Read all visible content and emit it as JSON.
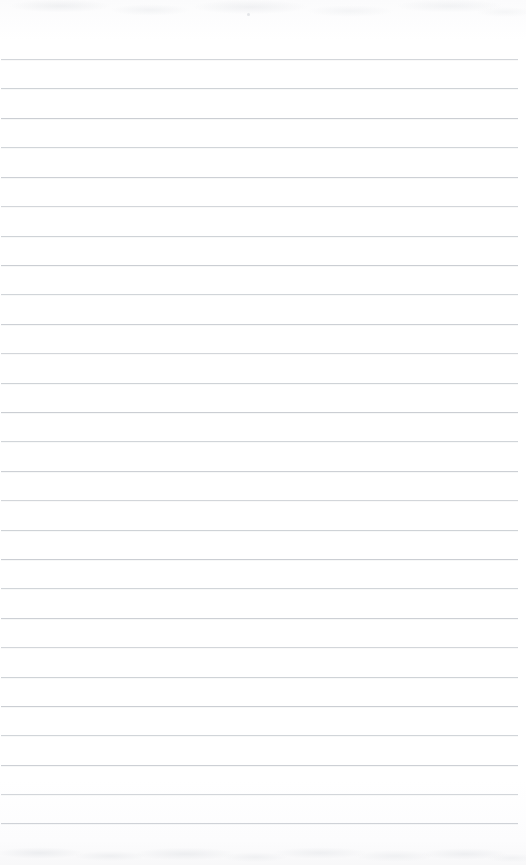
{
  "document": {
    "kind": "scanned-ruled-notepad-page",
    "page_width": 526,
    "page_height": 865,
    "paper_color": "#fdfdfd",
    "content_text": "",
    "handwriting_present": false,
    "printed_text_present": false
  },
  "ruling": {
    "line_color": "#c9cdd2",
    "line_thickness_px": 1,
    "line_spacing_px": 29.4,
    "first_line_y": 59,
    "line_start_x": 1,
    "line_end_x": 518,
    "line_count": 27,
    "lines_y": [
      59,
      88,
      118,
      147,
      177,
      206,
      236,
      265,
      294,
      324,
      353,
      383,
      412,
      441,
      471,
      500,
      530,
      559,
      588,
      618,
      647,
      677,
      706,
      735,
      765,
      794,
      823
    ]
  },
  "artifacts": {
    "top_band_label": "scan-shadow-top",
    "bottom_band_label": "scan-shadow-bottom",
    "speck_label": "dust-speck",
    "artifact_color": "#cdd1d6"
  }
}
